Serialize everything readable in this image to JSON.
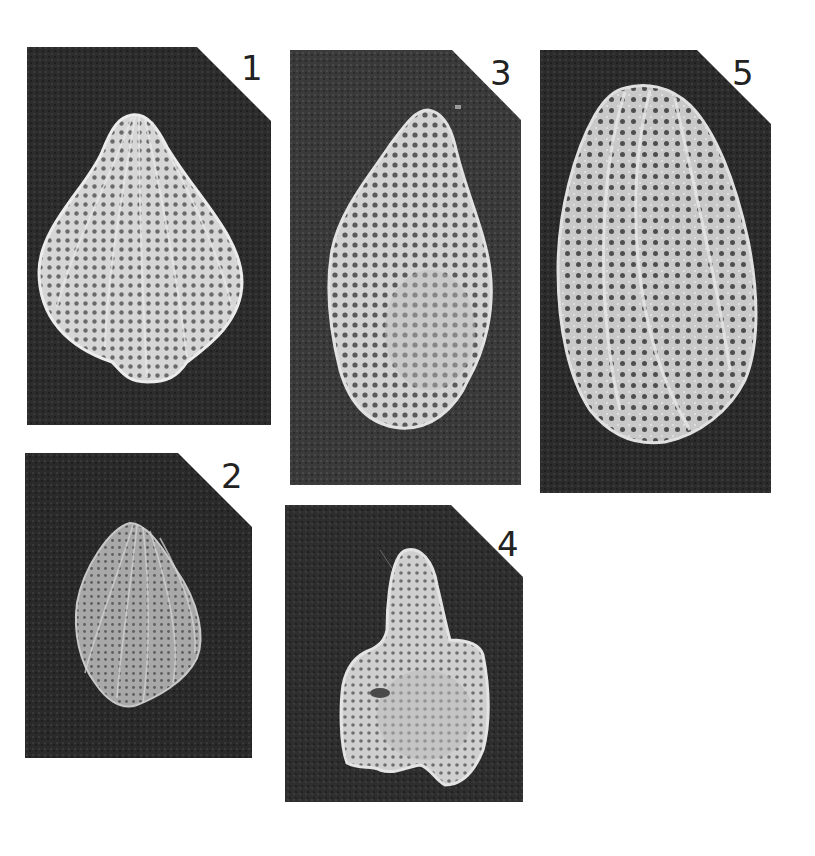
{
  "figure": {
    "background": "#ffffff",
    "panel_color": "#2c2c2c",
    "specimen_color": "#cfcfcf",
    "panels": [
      {
        "id": "1",
        "label": "1",
        "x": 27,
        "y": 47,
        "w": 244,
        "h": 378,
        "cut": 74,
        "shape": "pear-reticulate-ribbed"
      },
      {
        "id": "2",
        "label": "2",
        "x": 25,
        "y": 453,
        "w": 227,
        "h": 305,
        "cut": 74,
        "shape": "small-ribbed-ovoid"
      },
      {
        "id": "3",
        "label": "3",
        "x": 290,
        "y": 50,
        "w": 231,
        "h": 435,
        "cut": 70,
        "shape": "elongate-foveolate"
      },
      {
        "id": "4",
        "label": "4",
        "x": 285,
        "y": 505,
        "w": 238,
        "h": 297,
        "cut": 72,
        "shape": "necked-reticulate"
      },
      {
        "id": "5",
        "label": "5",
        "x": 540,
        "y": 50,
        "w": 231,
        "h": 443,
        "cut": 74,
        "shape": "elongate-ovate-costate"
      }
    ]
  }
}
